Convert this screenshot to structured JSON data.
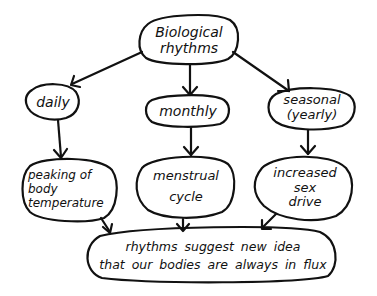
{
  "diagram": {
    "type": "concept-map",
    "style": "hand-drawn",
    "ink_color": "#111111",
    "background": "#ffffff",
    "root": {
      "id": "root",
      "label": "Biological\nrhythms"
    },
    "level1": [
      {
        "id": "daily",
        "label": "daily"
      },
      {
        "id": "monthly",
        "label": "monthly"
      },
      {
        "id": "seasonal",
        "label": "seasonal\n(yearly)"
      }
    ],
    "level2": [
      {
        "id": "peaking",
        "label": "peaking of\nbody\ntemperature"
      },
      {
        "id": "menstrual",
        "label": "menstrual\ncycle"
      },
      {
        "id": "sexdrive",
        "label": "increased\nsex\ndrive"
      }
    ],
    "conclusion": {
      "id": "conclusion",
      "label": "rhythms suggest new idea\nthat our bodies are always in flux"
    },
    "edges": [
      {
        "from": "root",
        "to": "daily"
      },
      {
        "from": "root",
        "to": "monthly"
      },
      {
        "from": "root",
        "to": "seasonal"
      },
      {
        "from": "daily",
        "to": "peaking"
      },
      {
        "from": "monthly",
        "to": "menstrual"
      },
      {
        "from": "seasonal",
        "to": "sexdrive"
      },
      {
        "from": "peaking",
        "to": "conclusion"
      },
      {
        "from": "menstrual",
        "to": "conclusion"
      },
      {
        "from": "sexdrive",
        "to": "conclusion"
      }
    ]
  }
}
